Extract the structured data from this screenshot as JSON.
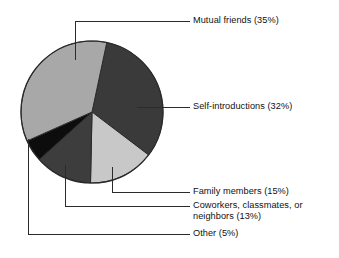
{
  "chart_data": {
    "type": "pie",
    "title": "",
    "subtitle": "",
    "xlabel": "",
    "ylabel": "",
    "legend_position": "callout-labels-right",
    "grid": false,
    "units": "percent",
    "total": 100,
    "start_angle_deg": 12,
    "direction": "clockwise",
    "categories": [
      "Mutual friends",
      "Self-introductions",
      "Family members",
      "Coworkers, classmates, or neighbors",
      "Other"
    ],
    "values": [
      35,
      32,
      15,
      13,
      5
    ],
    "colors": [
      "#a8a8a8",
      "#3a3a3a",
      "#c8c8c8",
      "#3d3d3d",
      "#0d0d0d"
    ],
    "slices": [
      {
        "name": "Mutual friends",
        "label": "Mutual friends (35%)",
        "value": 35,
        "color": "#a8a8a8",
        "start_deg": 197,
        "end_deg": 372
      },
      {
        "name": "Self-introductions",
        "label": "Self-introductions (32%)",
        "value": 32,
        "color": "#3a3a3a",
        "start_deg": 12,
        "end_deg": 127.2
      },
      {
        "name": "Family members",
        "label": "Family members (15%)",
        "value": 15,
        "color": "#c8c8c8",
        "start_deg": 127.2,
        "end_deg": 181.2
      },
      {
        "name": "Coworkers, classmates, or neighbors",
        "label": "Coworkers, classmates, or\nneighbors (13%)",
        "value": 13,
        "color": "#3d3d3d",
        "start_deg": 181.2,
        "end_deg": 228
      },
      {
        "name": "Other",
        "label": "Other (5%)",
        "value": 5,
        "color": "#0d0d0d",
        "start_deg": 228,
        "end_deg": 246
      }
    ]
  },
  "labels": {
    "mutual_friends": "Mutual friends (35%)",
    "self_introductions": "Self-introductions (32%)",
    "family_members": "Family members (15%)",
    "coworkers": "Coworkers, classmates, or\nneighbors (13%)",
    "other": "Other (5%)"
  },
  "style": {
    "background": "#ffffff",
    "text_color": "#111111",
    "leader_line_color": "#2b2b2b",
    "slice_outline_color": "#2b2b2b"
  }
}
